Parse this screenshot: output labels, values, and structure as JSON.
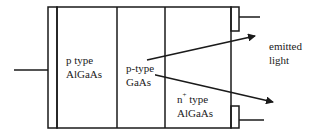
{
  "diagram": {
    "type": "LED / double-heterostructure cross-section",
    "stroke_color": "#1a1a1a",
    "background": "#ffffff",
    "layers": [
      {
        "id": "p-algaas",
        "line1": "p type",
        "line2": "AlGaAs"
      },
      {
        "id": "p-gaas",
        "line1": "p-type",
        "line2": "GaAs"
      },
      {
        "id": "n-algaas",
        "line1_base": "n",
        "line1_sup": "+",
        "line1_rest": " type",
        "line2": "AlGaAs"
      }
    ],
    "output_label": {
      "line1": "emitted",
      "line2": "light"
    }
  }
}
